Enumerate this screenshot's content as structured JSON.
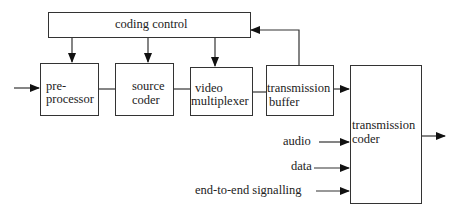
{
  "diagram": {
    "type": "block-diagram",
    "blocks": {
      "coding_control": "coding control",
      "preprocessor_line1": "pre-",
      "preprocessor_line2": "processor",
      "source_coder_line1": "source",
      "source_coder_line2": "coder",
      "video_mux_line1": "video",
      "video_mux_line2": "multiplexer",
      "tx_buffer_line1": "transmission",
      "tx_buffer_line2": "buffer",
      "tx_coder_line1": "transmission",
      "tx_coder_line2": "coder"
    },
    "inputs": {
      "audio": "audio",
      "data": "data",
      "signalling": "end-to-end signalling"
    },
    "edges": [
      {
        "from": "input",
        "to": "pre-processor"
      },
      {
        "from": "coding control",
        "to": "pre-processor"
      },
      {
        "from": "coding control",
        "to": "source coder"
      },
      {
        "from": "coding control",
        "to": "video multiplexer"
      },
      {
        "from": "pre-processor",
        "to": "source coder"
      },
      {
        "from": "source coder",
        "to": "video multiplexer"
      },
      {
        "from": "video multiplexer",
        "to": "transmission buffer"
      },
      {
        "from": "transmission buffer",
        "to": "coding control"
      },
      {
        "from": "transmission buffer",
        "to": "transmission coder"
      },
      {
        "from": "audio",
        "to": "transmission coder"
      },
      {
        "from": "data",
        "to": "transmission coder"
      },
      {
        "from": "end-to-end signalling",
        "to": "transmission coder"
      },
      {
        "from": "transmission coder",
        "to": "output"
      }
    ]
  }
}
